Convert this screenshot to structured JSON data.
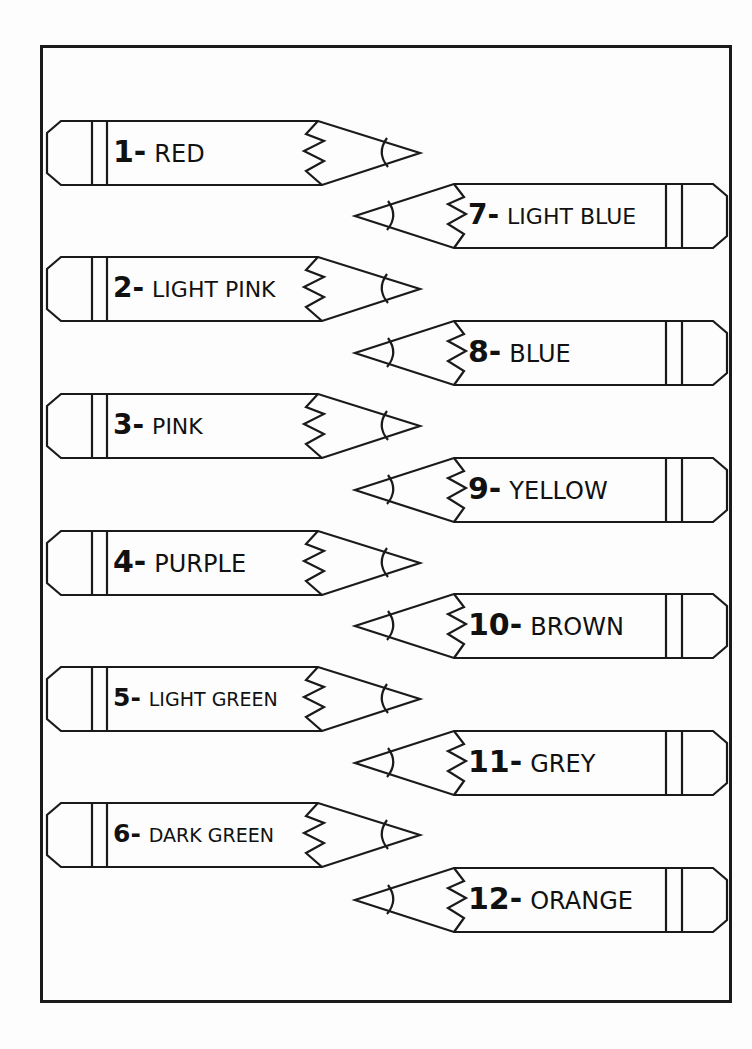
{
  "worksheet": {
    "frame_color": "#1a1a1a",
    "stroke_color": "#1a1a1a",
    "pencils": [
      {
        "number": "1-",
        "color_name": "RED",
        "side": "left",
        "top": 121,
        "label_size": 24
      },
      {
        "number": "7-",
        "color_name": "LIGHT BLUE",
        "side": "right",
        "top": 184,
        "label_size": 22
      },
      {
        "number": "2-",
        "color_name": "LIGHT PINK",
        "side": "left",
        "top": 257,
        "label_size": 22
      },
      {
        "number": "8-",
        "color_name": "BLUE",
        "side": "right",
        "top": 321,
        "label_size": 24
      },
      {
        "number": "3-",
        "color_name": "PINK",
        "side": "left",
        "top": 394,
        "label_size": 22
      },
      {
        "number": "9-",
        "color_name": "YELLOW",
        "side": "right",
        "top": 458,
        "label_size": 24
      },
      {
        "number": "4-",
        "color_name": "PURPLE",
        "side": "left",
        "top": 531,
        "label_size": 24
      },
      {
        "number": "10-",
        "color_name": "BROWN",
        "side": "right",
        "top": 594,
        "label_size": 24
      },
      {
        "number": "5-",
        "color_name": "LIGHT GREEN",
        "side": "left",
        "top": 667,
        "label_size": 19
      },
      {
        "number": "11-",
        "color_name": "GREY",
        "side": "right",
        "top": 731,
        "label_size": 24
      },
      {
        "number": "6-",
        "color_name": "DARK GREEN",
        "side": "left",
        "top": 803,
        "label_size": 19
      },
      {
        "number": "12-",
        "color_name": "ORANGE",
        "side": "right",
        "top": 868,
        "label_size": 24
      }
    ]
  }
}
